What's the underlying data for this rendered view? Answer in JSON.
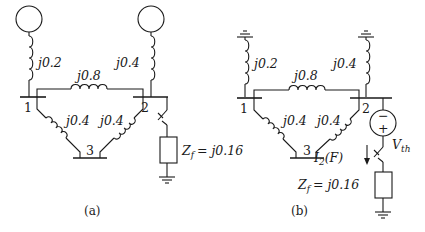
{
  "figure": {
    "panels": [
      {
        "id": "a",
        "caption": "(a)",
        "sources": [
          "generator",
          "generator"
        ],
        "buses": [
          "1",
          "2",
          "3"
        ],
        "impedances": {
          "gen1": "j0.2",
          "gen2": "j0.4",
          "line12": "j0.8",
          "line13": "j0.4",
          "line23": "j0.4"
        },
        "fault": {
          "bus": "2",
          "impedance_label": "Z",
          "impedance_sub": "f",
          "impedance_value": "= j0.16"
        }
      },
      {
        "id": "b",
        "caption": "(b)",
        "sources": [
          "ground",
          "ground"
        ],
        "buses": [
          "1",
          "2",
          "3"
        ],
        "impedances": {
          "gen1": "j0.2",
          "gen2": "j0.4",
          "line12": "j0.8",
          "line13": "j0.4",
          "line23": "j0.4"
        },
        "thevenin": {
          "label": "V",
          "sub": "th",
          "minus": "−",
          "plus": "+"
        },
        "current": {
          "label": "I",
          "sub": "2",
          "arg": "(F)"
        },
        "fault": {
          "bus": "2",
          "impedance_label": "Z",
          "impedance_sub": "f",
          "impedance_value": "= j0.16"
        }
      }
    ]
  }
}
